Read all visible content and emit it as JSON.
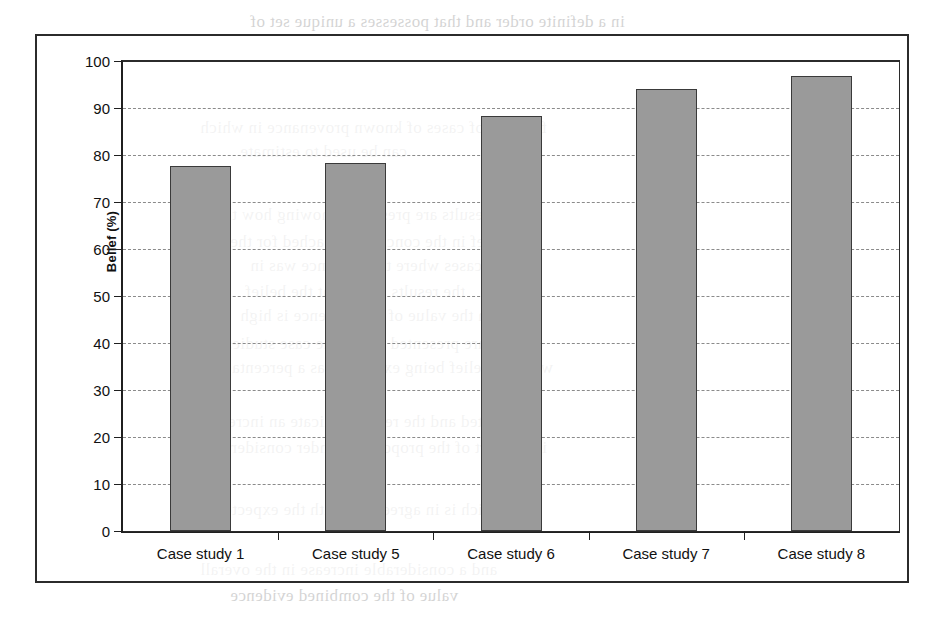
{
  "figure": {
    "y_axis_title": "Belief (%)",
    "x_axis_title": "",
    "title": ""
  },
  "chart_data": {
    "type": "bar",
    "title": "",
    "xlabel": "",
    "ylabel": "Belief (%)",
    "categories": [
      "Case study 1",
      "Case study 5",
      "Case study 6",
      "Case study 7",
      "Case study 8"
    ],
    "values": [
      77.6,
      78.2,
      88.3,
      94.1,
      96.8
    ],
    "ylim": [
      0,
      100
    ],
    "ytick_labels": [
      "100",
      "90",
      "80",
      "70",
      "60",
      "50",
      "40",
      "30",
      "20",
      "10",
      "0"
    ],
    "ytick_values": [
      100,
      90,
      80,
      70,
      60,
      50,
      40,
      30,
      20,
      10,
      0
    ],
    "grid": "horizontal-dashed",
    "legend": "none",
    "bar_fill_color": "#9a9a9a",
    "bar_border_color": "#3a3a3a",
    "gridline_color": "#8b8b8b",
    "axis_color": "#1f1f1f"
  },
  "scan_bleed": [
    {
      "text": "in a definite order and that possesses a unique set of",
      "x": 250,
      "y": 12
    },
    {
      "text": "for a set of cases of known provenance in which",
      "x": 200,
      "y": 118
    },
    {
      "text": "can be used to estimate",
      "x": 240,
      "y": 142
    },
    {
      "text": "the results are presented showing how the",
      "x": 215,
      "y": 205
    },
    {
      "text": "belief in the conclusion reached for the",
      "x": 230,
      "y": 232
    },
    {
      "text": "cases where the evidence was in",
      "x": 250,
      "y": 256
    },
    {
      "text": "the results show that the belief",
      "x": 245,
      "y": 282
    },
    {
      "text": "in the value of the evidence is high",
      "x": 240,
      "y": 306
    },
    {
      "text": "results are presented for all the case studies",
      "x": 225,
      "y": 334
    },
    {
      "text": "with the belief being expressed as a percentage",
      "x": 215,
      "y": 358
    },
    {
      "text": "reported and the results indicate an increase",
      "x": 205,
      "y": 412
    },
    {
      "text": "in support of the proposition under consideration",
      "x": 195,
      "y": 438
    },
    {
      "text": "which is in agreement with the expected",
      "x": 215,
      "y": 500
    },
    {
      "text": "and a considerable increase in the overall",
      "x": 200,
      "y": 560
    },
    {
      "text": "value of the combined evidence",
      "x": 230,
      "y": 586
    }
  ]
}
